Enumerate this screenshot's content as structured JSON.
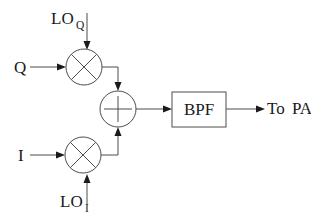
{
  "diagram": {
    "type": "block-diagram",
    "labels": {
      "q_input": "Q",
      "i_input": "I",
      "lo_q_main": "LO",
      "lo_q_sub": "Q",
      "lo_i_main": "LO",
      "lo_i_sub": "I",
      "bpf": "BPF",
      "output": "To PA"
    },
    "connections": [
      {
        "from": "Q",
        "to": "mixer-q"
      },
      {
        "from": "LO_Q",
        "to": "mixer-q"
      },
      {
        "from": "mixer-q",
        "to": "summer"
      },
      {
        "from": "I",
        "to": "mixer-i"
      },
      {
        "from": "LO_I",
        "to": "mixer-i"
      },
      {
        "from": "mixer-i",
        "to": "summer"
      },
      {
        "from": "summer",
        "to": "BPF"
      },
      {
        "from": "BPF",
        "to": "To PA"
      }
    ],
    "colors": {
      "background": "#ffffff",
      "line": "#4d4d4d",
      "arrow": "#1a1a1a",
      "text": "#1a1a1a"
    }
  }
}
